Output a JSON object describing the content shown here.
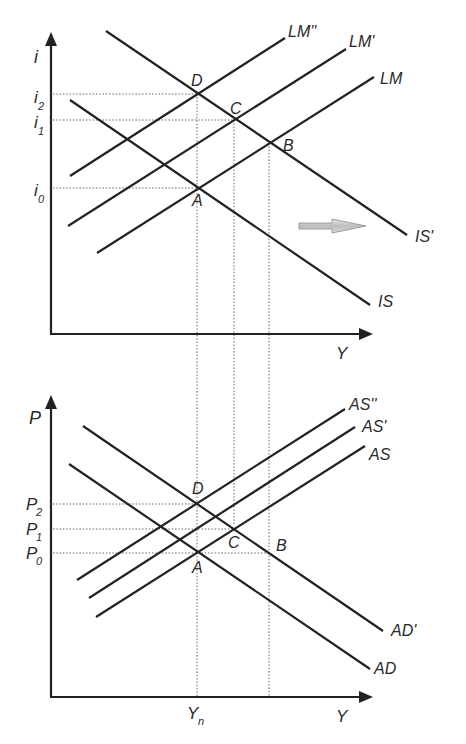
{
  "diagram": {
    "type": "IS-LM and AS-AD diagram",
    "top_panel": {
      "y_axis_label": "i",
      "x_axis_label": "Y",
      "rate_labels": {
        "i2": "i",
        "i2_sub": "2",
        "i1": "i",
        "i1_sub": "1",
        "i0": "i",
        "i0_sub": "0"
      },
      "curves": {
        "IS": "IS",
        "IS_prime": "IS'",
        "LM": "LM",
        "LM_prime": "LM'",
        "LM_double_prime": "LM''"
      },
      "points": {
        "A": "A",
        "B": "B",
        "C": "C",
        "D": "D"
      },
      "shift_arrow": "IS shift right"
    },
    "bottom_panel": {
      "y_axis_label": "P",
      "x_axis_label": "Y",
      "x_tick_label": "Y",
      "x_tick_sub": "n",
      "price_labels": {
        "p2": "P",
        "p2_sub": "2",
        "p1": "P",
        "p1_sub": "1",
        "p0": "P",
        "p0_sub": "0"
      },
      "curves": {
        "AD": "AD",
        "AD_prime": "AD'",
        "AS": "AS",
        "AS_prime": "AS'",
        "AS_double_prime": "AS''"
      },
      "points": {
        "A": "A",
        "B": "B",
        "C": "C",
        "D": "D"
      }
    },
    "colors": {
      "line": "#222222",
      "guide": "#555555",
      "arrow_fill": "#c8c8c8",
      "arrow_stroke": "#8a8a8a"
    }
  }
}
